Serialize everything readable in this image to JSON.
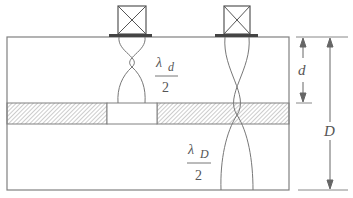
{
  "diagram": {
    "type": "ultrasonic-transducer-cross-section",
    "colors": {
      "line": "#777777",
      "plate": "#444444",
      "hatch": "#999999",
      "text": "#555555"
    },
    "transducers": [
      {
        "name": "left-transducer",
        "symbol": "boxed-x"
      },
      {
        "name": "right-transducer",
        "symbol": "boxed-x"
      }
    ],
    "labels": {
      "lambda_d_symbol": "λ",
      "lambda_d_sub": "d",
      "lambda_d_den": "2",
      "lambda_D_symbol": "λ",
      "lambda_D_sub": "D",
      "lambda_D_den": "2",
      "dim_d": "d",
      "dim_D": "D"
    }
  }
}
